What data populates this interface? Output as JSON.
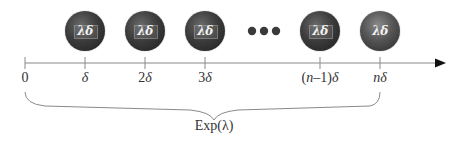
{
  "diagram": {
    "type": "timeline-with-coin-flips",
    "axis": {
      "color": "#8a8a8a",
      "arrow_color": "#111111",
      "ticks": [
        {
          "x": 25,
          "label_plain": "0"
        },
        {
          "x": 85,
          "label_plain": "δ"
        },
        {
          "x": 145,
          "label_plain": "2δ"
        },
        {
          "x": 205,
          "label_plain": "3δ"
        },
        {
          "x": 320,
          "label_plain": "(n–1)δ"
        },
        {
          "x": 380,
          "label_plain": "nδ"
        }
      ]
    },
    "labels": {
      "t0": "0",
      "t1": "δ",
      "t2_num": "2",
      "t2_sym": "δ",
      "t3_num": "3",
      "t3_sym": "δ",
      "tn1_open": "(",
      "tn1_n": "n",
      "tn1_rest": "–1)",
      "tn1_sym": "δ",
      "tn_n": "n",
      "tn_sym": "δ"
    },
    "coins": [
      {
        "x": 85,
        "label": "λδ",
        "face": "tails"
      },
      {
        "x": 145,
        "label": "λδ",
        "face": "tails"
      },
      {
        "x": 205,
        "label": "λδ",
        "face": "tails"
      },
      {
        "x": 320,
        "label": "λδ",
        "face": "tails"
      },
      {
        "x": 380,
        "label": "λδ",
        "face": "heads"
      }
    ],
    "ellipsis": {
      "dots": 3,
      "color": "#3a3a3a"
    },
    "brace": {
      "from": "0",
      "to": "nδ",
      "label": "Exp(λ)"
    }
  }
}
